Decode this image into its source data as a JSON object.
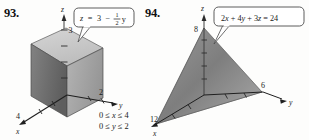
{
  "page": {
    "background": "#fdfdfc",
    "ink": "#1b1b1b"
  },
  "figures": [
    {
      "number": "93.",
      "equation": {
        "full": "z = 3 - (1/2)y",
        "lhs": "z",
        "eq": "=",
        "rhs_int": "3",
        "minus": "−",
        "frac_num": "1",
        "frac_den": "2",
        "var": "y"
      },
      "axes": {
        "z_label": "z",
        "y_label": "y",
        "x_label": "x"
      },
      "tick_labels": {
        "z": "3",
        "y": "2",
        "x": "4"
      },
      "constraints": [
        {
          "lo": "0 ≤ ",
          "var": "x",
          "hi": " ≤ 4"
        },
        {
          "lo": "0 ≤ ",
          "var": "y",
          "hi": " ≤ 2"
        }
      ],
      "solid": "rectangular-box",
      "colors": {
        "top_face": "#c9c9c9",
        "left_face": "#6e6e6e",
        "right_face": "#a8a8a8",
        "outline": "#4a4a4a"
      }
    },
    {
      "number": "94.",
      "equation": {
        "full": "2x + 4y + 3z = 24",
        "terms": [
          "2",
          "x",
          " + ",
          "4",
          "y",
          " + ",
          "3",
          "z",
          " = 24"
        ]
      },
      "axes": {
        "z_label": "z",
        "y_label": "y",
        "x_label": "x"
      },
      "tick_labels": {
        "z": "8",
        "y": "6",
        "x": "12"
      },
      "solid": "tetrahedron",
      "colors": {
        "front_face": "#8d8d8d",
        "left_face": "#b5b5b5",
        "bottom_face": "#cfcfcf",
        "outline": "#4a4a4a"
      }
    }
  ],
  "callout": {
    "fill": "#ffffff",
    "stroke": "#4a4a4a"
  }
}
